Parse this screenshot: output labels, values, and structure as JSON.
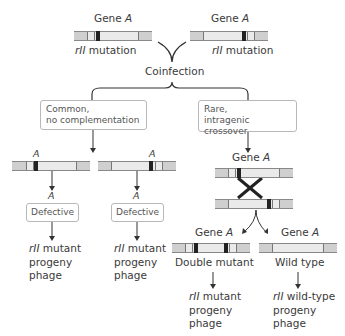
{
  "top": {
    "left_gene_label": "Gene",
    "left_gene_italic": "A",
    "right_gene_label": "Gene",
    "right_gene_italic": "A",
    "left_mutation_italic": "rII",
    "left_mutation_label": " mutation",
    "right_mutation_italic": "rII",
    "right_mutation_label": " mutation"
  },
  "coinfection_label": "Coinfection",
  "branches": {
    "left_box_line1": "Common,",
    "left_box_line2": "no complementation",
    "right_box_line1": "Rare,",
    "right_box_line2": "intragenic crossover"
  },
  "left_branch": {
    "a_label_1": "A",
    "a_label_2": "A",
    "a_label_3": "A",
    "a_label_4": "A",
    "defective_1": "Defective",
    "defective_2": "Defective",
    "outcome_1": {
      "italic": "rII",
      "line1": " mutant",
      "line2": "progeny",
      "line3": "phage"
    },
    "outcome_2": {
      "italic": "rII",
      "line1": " mutant",
      "line2": "progeny",
      "line3": "phage"
    }
  },
  "right_branch": {
    "gene_label": "Gene",
    "gene_italic": "A",
    "double_gene_label": "Gene",
    "double_gene_italic": "A",
    "wild_gene_label": "Gene",
    "wild_gene_italic": "A",
    "double_mutant_label": "Double mutant",
    "wild_type_label": "Wild type",
    "outcome_double": {
      "italic": "rII",
      "line1": " mutant",
      "line2": "progeny",
      "line3": "phage"
    },
    "outcome_wild": {
      "italic": "rII",
      "line1": " wild-type",
      "line2": "progeny",
      "line3": "phage"
    }
  },
  "colors": {
    "chromosome_fill": "#eaeaea",
    "chromosome_end": "#cfcfcf",
    "mutation": "#222222",
    "text": "#3a3a3a"
  }
}
